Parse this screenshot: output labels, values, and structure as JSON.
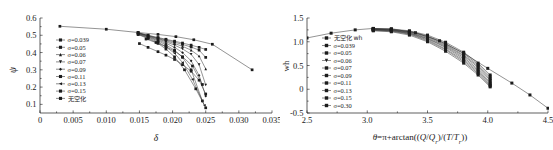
{
  "figure": {
    "background": "#ffffff",
    "ink": "#1b1b1b",
    "panel_count": 2
  },
  "chart_data": [
    {
      "id": "left",
      "type": "line",
      "title": "",
      "xlabel": "δ",
      "ylabel": "ψ",
      "xlim": [
        0,
        0.035
      ],
      "ylim": [
        0.05,
        0.6
      ],
      "xticks": [
        0,
        0.005,
        0.01,
        0.015,
        0.02,
        0.025,
        0.03,
        0.035
      ],
      "xtick_labels": [
        "0",
        "0.005",
        "0.010",
        "0.015",
        "0.020",
        "0.025",
        "0.030",
        "0.035"
      ],
      "yticks": [
        0.1,
        0.2,
        0.3,
        0.4,
        0.5,
        0.6
      ],
      "ytick_labels": [
        "0.1",
        "0.2",
        "0.3",
        "0.4",
        "0.5",
        "0.6"
      ],
      "grid": false,
      "legend_position": "upper-left-inside",
      "marker": "filled-square",
      "series": [
        {
          "name": "σ=0.039",
          "marker": "square",
          "x": [
            0.0148,
            0.0163,
            0.0178,
            0.019,
            0.0203,
            0.0215,
            0.0228,
            0.024,
            0.025
          ],
          "y": [
            0.515,
            0.5,
            0.487,
            0.477,
            0.466,
            0.455,
            0.443,
            0.43,
            0.418
          ]
        },
        {
          "name": "σ=0.05",
          "marker": "square",
          "x": [
            0.0148,
            0.0163,
            0.0178,
            0.019,
            0.0203,
            0.0215,
            0.0228,
            0.024,
            0.025
          ],
          "y": [
            0.514,
            0.499,
            0.484,
            0.473,
            0.46,
            0.447,
            0.432,
            0.414,
            0.372
          ]
        },
        {
          "name": "σ=0.06",
          "marker": "triangle",
          "x": [
            0.0148,
            0.0163,
            0.0178,
            0.019,
            0.0203,
            0.0215,
            0.0228,
            0.024,
            0.025
          ],
          "y": [
            0.513,
            0.497,
            0.481,
            0.468,
            0.452,
            0.436,
            0.414,
            0.38,
            0.305
          ]
        },
        {
          "name": "σ=0.07",
          "marker": "triangle-down",
          "x": [
            0.0148,
            0.0163,
            0.0178,
            0.019,
            0.0203,
            0.0215,
            0.0228,
            0.024,
            0.025
          ],
          "y": [
            0.512,
            0.495,
            0.478,
            0.462,
            0.443,
            0.421,
            0.39,
            0.33,
            0.212
          ]
        },
        {
          "name": "σ=0.09",
          "marker": "diamond",
          "x": [
            0.0148,
            0.0163,
            0.0178,
            0.019,
            0.0203,
            0.0215,
            0.0228,
            0.024,
            0.025
          ],
          "y": [
            0.51,
            0.492,
            0.473,
            0.454,
            0.43,
            0.4,
            0.352,
            0.268,
            0.148
          ]
        },
        {
          "name": "σ=0.11",
          "marker": "square",
          "x": [
            0.0148,
            0.0163,
            0.0178,
            0.019,
            0.0203,
            0.0215,
            0.0228,
            0.0245
          ],
          "y": [
            0.508,
            0.489,
            0.468,
            0.444,
            0.414,
            0.372,
            0.3,
            0.12
          ]
        },
        {
          "name": "σ=0.13",
          "marker": "left-triangle",
          "x": [
            0.0148,
            0.0163,
            0.0178,
            0.019,
            0.0203,
            0.0215,
            0.023,
            0.0248
          ],
          "y": [
            0.506,
            0.485,
            0.461,
            0.433,
            0.396,
            0.342,
            0.245,
            0.095
          ]
        },
        {
          "name": "σ=0.15",
          "marker": "square",
          "x": [
            0.0148,
            0.0163,
            0.0178,
            0.019,
            0.0203,
            0.0218,
            0.0235,
            0.025
          ],
          "y": [
            0.504,
            0.481,
            0.453,
            0.42,
            0.375,
            0.3,
            0.19,
            0.08
          ]
        },
        {
          "name": "无空化",
          "marker": "square",
          "is_reference": true,
          "x": [
            0.003,
            0.01,
            0.0148,
            0.0178,
            0.0205,
            0.0232,
            0.026,
            0.032
          ],
          "y": [
            0.552,
            0.535,
            0.516,
            0.505,
            0.492,
            0.474,
            0.448,
            0.3
          ]
        },
        {
          "name": "lower-branch-a",
          "marker": "square",
          "hidden_from_legend": true,
          "x": [
            0.015,
            0.0163,
            0.0178,
            0.019,
            0.0203,
            0.0215,
            0.0228,
            0.024,
            0.025
          ],
          "y": [
            0.452,
            0.43,
            0.405,
            0.385,
            0.36,
            0.33,
            0.292,
            0.24,
            0.16
          ]
        },
        {
          "name": "lower-branch-b",
          "marker": "square",
          "hidden_from_legend": true,
          "x": [
            0.016,
            0.0175,
            0.019,
            0.0203,
            0.0215,
            0.023,
            0.0245
          ],
          "y": [
            0.478,
            0.458,
            0.434,
            0.408,
            0.376,
            0.322,
            0.215
          ]
        }
      ]
    },
    {
      "id": "right",
      "type": "line",
      "title": "",
      "xlabel": "θ=π+arctan((Q/Q_r)/(T/T_r))",
      "xlabel_parts": {
        "theta": "θ",
        "equals": "=",
        "pi": "π",
        "plus": "+",
        "fn": "arctan((",
        "q": "Q",
        "slash1": "/",
        "qr": "Q",
        "qr_sub": "r",
        "close1": ")/(",
        "t": "T",
        "slash2": "/",
        "tr": "T",
        "tr_sub": "r",
        "close2": "))"
      },
      "ylabel": "wh",
      "xlim": [
        2.5,
        4.5
      ],
      "ylim": [
        -0.5,
        1.5
      ],
      "xticks": [
        2.5,
        3.0,
        3.5,
        4.0,
        4.5
      ],
      "xtick_labels": [
        "2.5",
        "3.0",
        "3.5",
        "4.0",
        "4.5"
      ],
      "yticks": [
        -0.5,
        0,
        0.5,
        1.0,
        1.5
      ],
      "ytick_labels": [
        "-0.5",
        "0",
        "0.5",
        "1.0",
        "1.5"
      ],
      "grid": false,
      "legend_position": "upper-left-inside",
      "marker": "filled-square",
      "series": [
        {
          "name": "无空化 wh",
          "marker": "square",
          "is_reference": true,
          "x": [
            2.5,
            2.7,
            2.9,
            3.05,
            3.2,
            3.4,
            3.6,
            3.8,
            4.0,
            4.2,
            4.35,
            4.5
          ],
          "y": [
            1.08,
            1.18,
            1.25,
            1.28,
            1.27,
            1.19,
            1.02,
            0.76,
            0.44,
            0.13,
            -0.12,
            -0.4
          ]
        },
        {
          "name": "σ=0.039",
          "marker": "square",
          "x": [
            3.05,
            3.2,
            3.35,
            3.5,
            3.65,
            3.8,
            3.92,
            4.02
          ],
          "y": [
            1.28,
            1.27,
            1.23,
            1.14,
            0.99,
            0.78,
            0.55,
            0.3
          ]
        },
        {
          "name": "σ=0.05",
          "marker": "square",
          "x": [
            3.05,
            3.2,
            3.35,
            3.5,
            3.65,
            3.8,
            3.92,
            4.02
          ],
          "y": [
            1.27,
            1.26,
            1.22,
            1.12,
            0.96,
            0.75,
            0.52,
            0.26
          ]
        },
        {
          "name": "σ=0.06",
          "marker": "square",
          "x": [
            3.05,
            3.2,
            3.35,
            3.5,
            3.65,
            3.8,
            3.92,
            4.02
          ],
          "y": [
            1.27,
            1.25,
            1.21,
            1.11,
            0.94,
            0.72,
            0.49,
            0.22
          ]
        },
        {
          "name": "σ=0.07",
          "marker": "square",
          "x": [
            3.05,
            3.2,
            3.35,
            3.5,
            3.65,
            3.8,
            3.92,
            4.02
          ],
          "y": [
            1.26,
            1.25,
            1.2,
            1.09,
            0.92,
            0.7,
            0.46,
            0.19
          ]
        },
        {
          "name": "σ=0.09",
          "marker": "square",
          "x": [
            3.05,
            3.2,
            3.35,
            3.5,
            3.65,
            3.8,
            3.92,
            4.02
          ],
          "y": [
            1.26,
            1.24,
            1.19,
            1.07,
            0.9,
            0.67,
            0.42,
            0.15
          ]
        },
        {
          "name": "σ=0.11",
          "marker": "square",
          "x": [
            3.05,
            3.2,
            3.35,
            3.5,
            3.65,
            3.8,
            3.92,
            4.02
          ],
          "y": [
            1.25,
            1.24,
            1.18,
            1.06,
            0.88,
            0.64,
            0.39,
            0.12
          ]
        },
        {
          "name": "σ=0.13",
          "marker": "square",
          "x": [
            3.05,
            3.2,
            3.35,
            3.5,
            3.65,
            3.8,
            3.92,
            4.02
          ],
          "y": [
            1.25,
            1.23,
            1.17,
            1.04,
            0.85,
            0.61,
            0.36,
            0.09
          ]
        },
        {
          "name": "σ=0.15",
          "marker": "square",
          "x": [
            3.05,
            3.2,
            3.35,
            3.5,
            3.65,
            3.8,
            3.92,
            4.02
          ],
          "y": [
            1.24,
            1.22,
            1.16,
            1.02,
            0.83,
            0.58,
            0.33,
            0.07
          ]
        },
        {
          "name": "σ=0.30",
          "marker": "square",
          "x": [
            3.05,
            3.2,
            3.35,
            3.5,
            3.65,
            3.8,
            3.92,
            4.02
          ],
          "y": [
            1.23,
            1.21,
            1.14,
            1.0,
            0.8,
            0.55,
            0.3,
            0.05
          ]
        }
      ]
    }
  ],
  "left_panel": {
    "legend": [
      {
        "label": "σ=0.039",
        "marker": "square"
      },
      {
        "label": "σ=0.05",
        "marker": "square"
      },
      {
        "label": "σ=0.06",
        "marker": "triangle"
      },
      {
        "label": "σ=0.07",
        "marker": "triangle-down"
      },
      {
        "label": "σ=0.09",
        "marker": "diamond"
      },
      {
        "label": "σ=0.11",
        "marker": "square"
      },
      {
        "label": "σ=0.13",
        "marker": "left-triangle"
      },
      {
        "label": "σ=0.15",
        "marker": "square"
      },
      {
        "label": "无空化",
        "marker": "square"
      }
    ]
  },
  "right_panel": {
    "legend": [
      {
        "label": "无空化 wh",
        "marker": "square"
      },
      {
        "label": "σ=0.039",
        "marker": "square"
      },
      {
        "label": "σ=0.05",
        "marker": "square"
      },
      {
        "label": "σ=0.06",
        "marker": "triangle-down"
      },
      {
        "label": "σ=0.07",
        "marker": "square"
      },
      {
        "label": "σ=0.09",
        "marker": "square"
      },
      {
        "label": "σ=0.11",
        "marker": "square"
      },
      {
        "label": "σ=0.13",
        "marker": "square"
      },
      {
        "label": "σ=0.15",
        "marker": "square"
      },
      {
        "label": "σ=0.30",
        "marker": "square"
      }
    ]
  }
}
